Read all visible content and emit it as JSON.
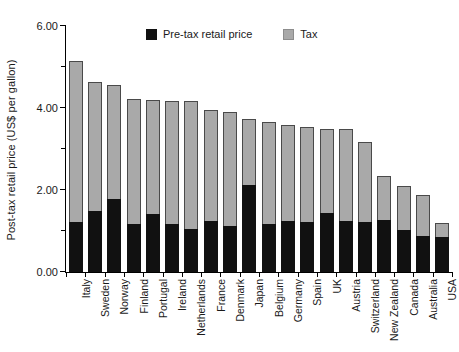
{
  "chart_data": {
    "type": "bar",
    "stacked": true,
    "title": "",
    "xlabel": "",
    "ylabel": "Post-tax retail price (US$ per gallon)",
    "ylim": [
      0.0,
      6.0
    ],
    "ytick_labels": [
      "0.00",
      "2.00",
      "4.00",
      "6.00"
    ],
    "ytick_values": [
      0.0,
      2.0,
      4.0,
      6.0
    ],
    "yminor_values": [
      1.0,
      3.0,
      5.0
    ],
    "grid": false,
    "legend_position": "top-center",
    "categories": [
      "Italy",
      "Sweden",
      "Norway",
      "Finland",
      "Portugal",
      "Ireland",
      "Netherlands",
      "France",
      "Denmark",
      "Japan",
      "Belgium",
      "Germany",
      "Spain",
      "UK",
      "Austria",
      "Switzerland",
      "New Zealand",
      "Canada",
      "Australia",
      "USA"
    ],
    "series": [
      {
        "name": "Pre-tax retail price",
        "color": "#111111",
        "values": [
          1.22,
          1.5,
          1.78,
          1.16,
          1.41,
          1.16,
          1.04,
          1.25,
          1.12,
          2.13,
          1.17,
          1.25,
          1.22,
          1.44,
          1.24,
          1.22,
          1.26,
          1.02,
          0.88,
          0.85
        ]
      },
      {
        "name": "Tax",
        "color": "#a9a9a9",
        "values": [
          3.93,
          3.13,
          2.78,
          3.06,
          2.79,
          3.01,
          3.12,
          2.7,
          2.78,
          1.59,
          2.48,
          2.33,
          2.32,
          2.06,
          2.25,
          1.96,
          1.09,
          1.07,
          1.0,
          0.35
        ]
      }
    ],
    "totals": [
      5.15,
      4.63,
      4.56,
      4.22,
      4.2,
      4.17,
      4.16,
      3.95,
      3.9,
      3.72,
      3.65,
      3.58,
      3.54,
      3.5,
      3.49,
      3.18,
      2.35,
      2.09,
      1.88,
      1.2
    ]
  },
  "legend": {
    "items": [
      {
        "label": "Pre-tax retail price",
        "swatch": "pretax"
      },
      {
        "label": "Tax",
        "swatch": "tax"
      }
    ]
  }
}
